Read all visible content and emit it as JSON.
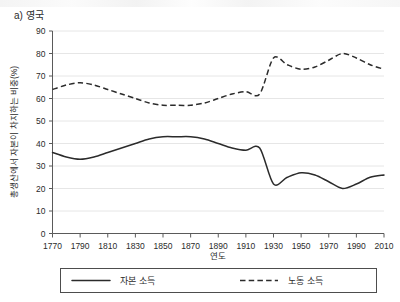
{
  "panel": {
    "title": "a) 영국"
  },
  "chart_data": {
    "type": "line",
    "title": "a) 영국",
    "xlabel": "연도",
    "ylabel": "총생산에서 자본이 차지하는 비중(%)",
    "xlim": [
      1770,
      2010
    ],
    "ylim": [
      0,
      90
    ],
    "xticks": [
      1770,
      1790,
      1810,
      1830,
      1850,
      1870,
      1890,
      1910,
      1930,
      1950,
      1970,
      1990,
      2010
    ],
    "yticks": [
      0,
      10,
      20,
      30,
      40,
      50,
      60,
      70,
      80,
      90
    ],
    "grid": true,
    "legend_position": "below",
    "x": [
      1770,
      1780,
      1790,
      1800,
      1810,
      1820,
      1830,
      1840,
      1850,
      1860,
      1870,
      1880,
      1890,
      1900,
      1910,
      1920,
      1930,
      1940,
      1950,
      1960,
      1970,
      1980,
      1990,
      2000,
      2010
    ],
    "series": [
      {
        "name": "자본 소득",
        "style": "solid",
        "color": "#2b2b2b",
        "values": [
          36,
          34,
          33,
          34,
          36,
          38,
          40,
          42,
          43,
          43,
          43,
          42,
          40,
          38,
          37,
          38,
          22,
          25,
          27,
          26,
          23,
          20,
          22,
          25,
          26
        ]
      },
      {
        "name": "노동 소득",
        "style": "dashed",
        "color": "#2b2b2b",
        "values": [
          64,
          66,
          67,
          66,
          64,
          62,
          60,
          58,
          57,
          57,
          57,
          58,
          60,
          62,
          63,
          62,
          78,
          75,
          73,
          74,
          77,
          80,
          78,
          75,
          73
        ]
      }
    ]
  },
  "legend": {
    "items": [
      {
        "label": "자본 소득",
        "style": "solid"
      },
      {
        "label": "노동 소득",
        "style": "dashed"
      }
    ]
  }
}
